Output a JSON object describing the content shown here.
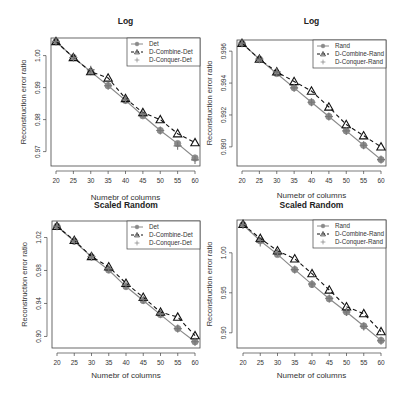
{
  "chart_data": [
    {
      "type": "line",
      "title": "Log",
      "xlabel": "Numebr of columns",
      "ylabel": "Reconstruction error ratio",
      "x": [
        20,
        25,
        30,
        35,
        40,
        45,
        50,
        55,
        60
      ],
      "xticks": [
        20,
        25,
        30,
        35,
        40,
        45,
        50,
        55,
        60
      ],
      "yticks": [
        0.97,
        0.98,
        0.99,
        1.0
      ],
      "ytick_labels": [
        "0.97",
        "0.98",
        "0.99",
        "1.00"
      ],
      "ylim": [
        0.9655,
        1.0055
      ],
      "legend_position": "topright",
      "grid": false,
      "series": [
        {
          "name": "Det",
          "style": "solid",
          "marker": "circle",
          "values": [
            1.0044,
            0.9994,
            0.995,
            0.9906,
            0.986,
            0.9812,
            0.9766,
            0.9725,
            0.968
          ]
        },
        {
          "name": "D-Combine-Det",
          "style": "dashed",
          "marker": "triangle",
          "values": [
            1.0044,
            0.9994,
            0.995,
            0.993,
            0.9866,
            0.9822,
            0.98,
            0.9756,
            0.9728
          ]
        },
        {
          "name": "D-Conquer-Det",
          "style": "none",
          "marker": "plus",
          "values": [
            1.0044,
            0.9994,
            0.9956,
            0.9906,
            0.9862,
            0.9818,
            0.9766,
            0.9718,
            0.9674
          ]
        }
      ]
    },
    {
      "type": "line",
      "title": "Log",
      "xlabel": "Numebr of columns",
      "ylabel": "Reconstruction error ratio",
      "x": [
        20,
        25,
        30,
        35,
        40,
        45,
        50,
        55,
        60
      ],
      "xticks": [
        20,
        25,
        30,
        35,
        40,
        45,
        50,
        55,
        60
      ],
      "yticks": [
        0.99,
        0.992,
        0.994,
        0.996
      ],
      "ytick_labels": [
        "0.990",
        "0.992",
        "0.994",
        "0.996"
      ],
      "ylim": [
        0.9888,
        0.9967
      ],
      "legend_position": "topright",
      "grid": false,
      "series": [
        {
          "name": "Rand",
          "style": "solid",
          "marker": "circle",
          "values": [
            0.9965,
            0.9955,
            0.9946,
            0.9937,
            0.9928,
            0.9919,
            0.991,
            0.9901,
            0.9892
          ]
        },
        {
          "name": "D-Combine-Rand",
          "style": "dashed",
          "marker": "triangle",
          "values": [
            0.9965,
            0.9955,
            0.9947,
            0.9941,
            0.9935,
            0.9925,
            0.9914,
            0.9907,
            0.99
          ]
        },
        {
          "name": "D-Conquer-Rand",
          "style": "none",
          "marker": "plus",
          "values": [
            0.9965,
            0.9955,
            0.9947,
            0.9937,
            0.9928,
            0.9919,
            0.991,
            0.9901,
            0.9892
          ]
        }
      ]
    },
    {
      "type": "line",
      "title": "Scaled Random",
      "xlabel": "Numebr of columns",
      "ylabel": "Reconstruction error ratio",
      "x": [
        20,
        25,
        30,
        35,
        40,
        45,
        50,
        55,
        60
      ],
      "xticks": [
        20,
        25,
        30,
        35,
        40,
        45,
        50,
        55,
        60
      ],
      "yticks": [
        0.9,
        0.94,
        0.98,
        1.02
      ],
      "ytick_labels": [
        "0.90",
        "0.94",
        "0.98",
        "1.02"
      ],
      "ylim": [
        0.886,
        1.04
      ],
      "legend_position": "topright",
      "grid": false,
      "series": [
        {
          "name": "Det",
          "style": "solid",
          "marker": "circle",
          "values": [
            1.0336,
            1.0155,
            0.9965,
            0.9805,
            0.9605,
            0.9436,
            0.9265,
            0.9095,
            0.8935
          ]
        },
        {
          "name": "D-Combine-Det",
          "style": "dashed",
          "marker": "triangle",
          "values": [
            1.0336,
            1.0165,
            0.997,
            0.9845,
            0.9645,
            0.9475,
            0.9295,
            0.9235,
            0.901
          ]
        },
        {
          "name": "D-Conquer-Det",
          "style": "none",
          "marker": "plus",
          "values": [
            1.0336,
            1.016,
            0.997,
            0.982,
            0.962,
            0.9445,
            0.9275,
            0.9095,
            0.8935
          ]
        }
      ]
    },
    {
      "type": "line",
      "title": "Scaled Random",
      "xlabel": "Numebr of columns",
      "ylabel": "Reconstruction error ratio",
      "x": [
        20,
        25,
        30,
        35,
        40,
        45,
        50,
        55,
        60
      ],
      "xticks": [
        20,
        25,
        30,
        35,
        40,
        45,
        50,
        55,
        60
      ],
      "yticks": [
        0.9,
        0.95,
        1.0
      ],
      "ytick_labels": [
        "0.90",
        "0.95",
        "1.00"
      ],
      "ylim": [
        0.881,
        1.041
      ],
      "legend_position": "topright",
      "grid": false,
      "series": [
        {
          "name": "Rand",
          "style": "solid",
          "marker": "circle",
          "values": [
            1.035,
            1.015,
            0.998,
            0.979,
            0.9605,
            0.9425,
            0.926,
            0.9085,
            0.8905
          ]
        },
        {
          "name": "D-Combine-Rand",
          "style": "dashed",
          "marker": "triangle",
          "values": [
            1.0355,
            1.018,
            1.0025,
            0.9925,
            0.974,
            0.9535,
            0.9325,
            0.924,
            0.9015
          ]
        },
        {
          "name": "D-Conquer-Rand",
          "style": "none",
          "marker": "plus",
          "values": [
            1.035,
            1.013,
            1.0,
            0.979,
            0.961,
            0.943,
            0.926,
            0.908,
            0.89
          ]
        }
      ]
    }
  ],
  "panels": [
    {
      "title": "Log",
      "xlabel": "Numebr of columns",
      "ylabel": "Reconstruction error ratio"
    },
    {
      "title": "Log",
      "xlabel": "Numebr of columns",
      "ylabel": "Reconstruction error ratio"
    },
    {
      "title": "Scaled Random",
      "xlabel": "Numebr of columns",
      "ylabel": "Reconstruction error ratio"
    },
    {
      "title": "Scaled Random",
      "xlabel": "Numebr of columns",
      "ylabel": "Reconstruction error ratio"
    }
  ],
  "layout": [
    {
      "left": 51,
      "right": 200,
      "top": 38,
      "bottom": 166,
      "x0": 56,
      "x1": 195,
      "ytop": 0.9655,
      "titleY": 24,
      "xlabelY": 200
    },
    {
      "left": 237,
      "right": 386,
      "top": 40,
      "bottom": 166,
      "x0": 242,
      "x1": 381,
      "titleY": 24,
      "xlabelY": 198
    },
    {
      "left": 52,
      "right": 200,
      "top": 221,
      "bottom": 348,
      "x0": 57,
      "x1": 195,
      "titleY": 208,
      "xlabelY": 378
    },
    {
      "left": 237,
      "right": 386,
      "top": 220,
      "bottom": 348,
      "x0": 243,
      "x1": 381,
      "titleY": 208,
      "xlabelY": 378
    }
  ],
  "colors": {
    "axis": "#444444",
    "series_solid": "#8a8a8a",
    "series_dashed": "#111111",
    "series_plus": "#777777"
  }
}
